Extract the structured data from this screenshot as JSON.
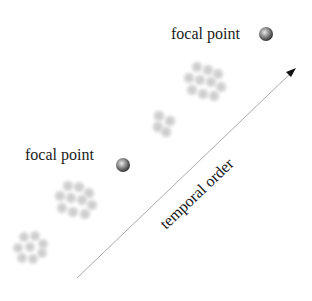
{
  "diagram": {
    "labels": {
      "focal_point_top": "focal point",
      "focal_point_middle": "focal point",
      "axis": "temporal order"
    },
    "colors": {
      "background": "#ffffff",
      "text": "#1a1a1a",
      "arrow": "#9a9a9a",
      "arrowhead": "#111111",
      "cluster_cell": "#d0d0d0",
      "sphere_highlight": "#e6e6e6",
      "sphere_shadow": "#3c3c3c"
    },
    "clusters": [
      {
        "name": "cluster-bottom-left",
        "cx": 30,
        "cy": 247
      },
      {
        "name": "cluster-lower-middle",
        "cx": 75,
        "cy": 200
      },
      {
        "name": "cluster-small",
        "cx": 163,
        "cy": 123
      },
      {
        "name": "cluster-upper",
        "cx": 204,
        "cy": 80
      }
    ],
    "focal_points": [
      {
        "name": "focal-point-top",
        "cx": 266,
        "cy": 34
      },
      {
        "name": "focal-point-middle",
        "cx": 123,
        "cy": 165
      }
    ],
    "arrow": {
      "x1": 77,
      "y1": 278,
      "x2": 296,
      "y2": 68
    }
  }
}
